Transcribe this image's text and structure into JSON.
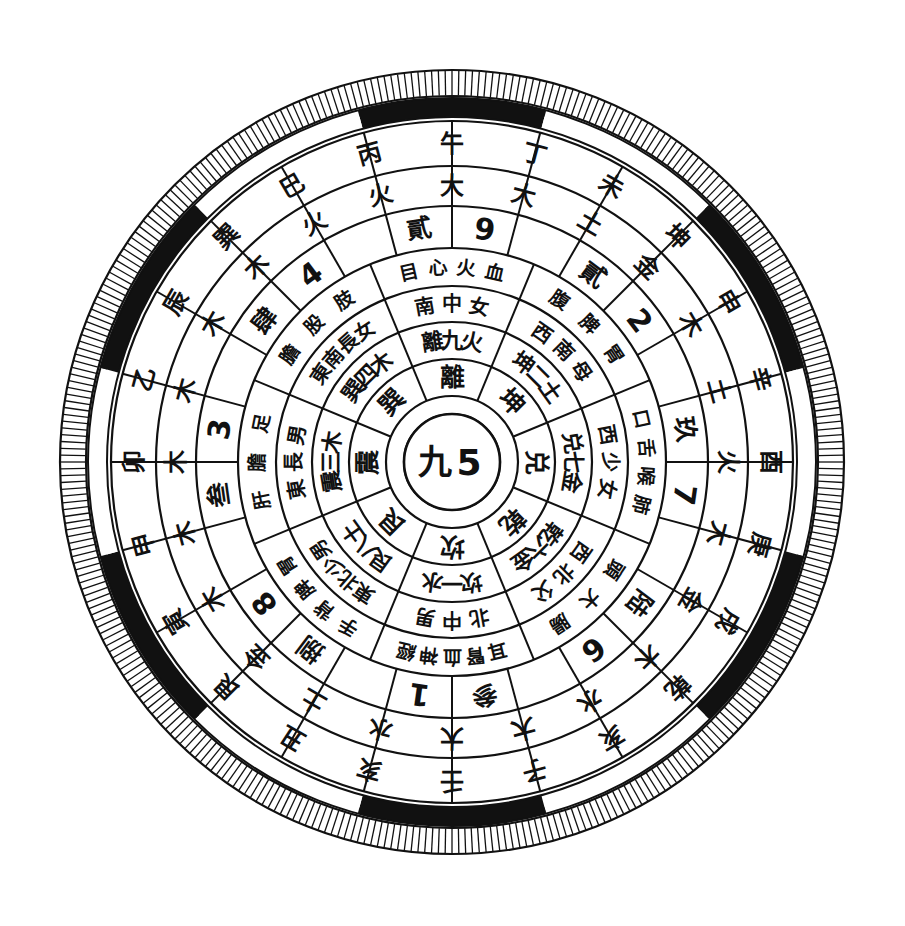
{
  "diagram": {
    "title": "九5",
    "center": {
      "chinese_numeral": "九",
      "arabic_numeral": "5"
    },
    "colors": {
      "ink": "#111111",
      "paper": "#ffffff",
      "band_dark": "#111111",
      "band_light": "#ffffff"
    },
    "rings": [
      {
        "id": "ring-degree-ticks",
        "name": "outer-degree-scale",
        "segments": 360
      },
      {
        "id": "ring-arc-band",
        "name": "alternating-black-white-band",
        "segments": 12
      },
      {
        "id": "ring-branch",
        "name": "earthly-branches-ring",
        "segments": 12
      },
      {
        "id": "ring-element",
        "name": "five-elements-ring",
        "segments": 12
      },
      {
        "id": "ring-number",
        "name": "numbers-ring",
        "segments": 12
      },
      {
        "id": "ring-body",
        "name": "body-organs-ring",
        "segments": 8
      },
      {
        "id": "ring-family",
        "name": "direction-family-ring",
        "segments": 8
      },
      {
        "id": "ring-trigram-element",
        "name": "trigram-number-element-ring",
        "segments": 8
      },
      {
        "id": "ring-trigram",
        "name": "eight-trigrams-ring",
        "segments": 8
      }
    ],
    "ring_branch": {
      "label": "earthly-branches",
      "cells": [
        "卯",
        "甲",
        "寅",
        "艮",
        "丑",
        "癸",
        "子",
        "壬",
        "亥",
        "乾",
        "戌",
        "辛",
        "酉",
        "庚",
        "申",
        "坤",
        "未",
        "丁",
        "午",
        "丙",
        "巳",
        "巽",
        "辰",
        "乙"
      ]
    },
    "ring_element": {
      "label": "five-elements-outer",
      "cells": [
        "木",
        "木",
        "木",
        "土",
        "金",
        "大",
        "大",
        "大",
        "水",
        "木",
        "金",
        "土",
        "火",
        "大",
        "木",
        "土",
        "火",
        "土",
        "大",
        "火",
        "木",
        "木",
        "木",
        "木"
      ]
    },
    "ring_number": {
      "label": "numbers-outer",
      "cells": [
        "叁",
        "3",
        "捌",
        "8",
        "五",
        "参",
        "1",
        "一",
        "陆",
        "6",
        "二",
        "玖",
        "7",
        "四",
        "貳",
        "9",
        "八",
        "4"
      ]
    },
    "ring_number_pairs": [
      {
        "cn": "叁",
        "ar": "3"
      },
      {
        "cn": "肆",
        "ar": "4"
      },
      {
        "cn": "捌",
        "ar": "8"
      },
      {
        "cn": "五",
        "ar": "5"
      },
      {
        "cn": "参",
        "ar": "3"
      },
      {
        "cn": "壹",
        "ar": "1"
      },
      {
        "cn": "陆",
        "ar": "6"
      },
      {
        "cn": "贰",
        "ar": "2"
      },
      {
        "cn": "玖",
        "ar": "9"
      },
      {
        "cn": "柒",
        "ar": "7"
      },
      {
        "cn": "贰",
        "ar": "2"
      },
      {
        "cn": "玖",
        "ar": "9"
      }
    ],
    "trigram_sectors": [
      {
        "name": "kan",
        "trigram": "坎",
        "number": "一",
        "element": "水",
        "direction": "北",
        "family": "中男",
        "body": "耳腎血神經",
        "numeral_cn": "参",
        "numeral_ar": "1",
        "outer_elements": "大 大 水",
        "branches": "子 壬 亥"
      },
      {
        "name": "gen",
        "trigram": "艮",
        "number": "八",
        "element": "土",
        "direction": "東北",
        "family": "少男",
        "body": "手背脾胃",
        "numeral_cn": "捌",
        "numeral_ar": "8",
        "outer_elements": "土 金 木",
        "branches": "丑 艮 寅"
      },
      {
        "name": "zhen",
        "trigram": "震",
        "number": "三",
        "element": "木",
        "direction": "東",
        "family": "長男",
        "body": "肝膽足",
        "numeral_cn": "叁",
        "numeral_ar": "3",
        "outer_elements": "木 木 木",
        "branches": "甲 卯 乙"
      },
      {
        "name": "xun",
        "trigram": "巽",
        "number": "四",
        "element": "木",
        "direction": "東南",
        "family": "長女",
        "body": "膽股肢",
        "numeral_cn": "肆",
        "numeral_ar": "4",
        "outer_elements": "木 木 火",
        "branches": "辰 巽 巳"
      },
      {
        "name": "li",
        "trigram": "離",
        "number": "九",
        "element": "火",
        "direction": "南",
        "family": "中女",
        "body": "目心火血",
        "numeral_cn": "貳",
        "numeral_ar": "9",
        "outer_elements": "火 大 大",
        "branches": "丙 午 丁"
      },
      {
        "name": "kun",
        "trigram": "坤",
        "number": "二",
        "element": "土",
        "direction": "西南",
        "family": "母",
        "body": "腹脾胃",
        "numeral_cn": "貳",
        "numeral_ar": "2",
        "outer_elements": "土 金 木",
        "branches": "未 坤 申"
      },
      {
        "name": "dui",
        "trigram": "兑",
        "number": "七",
        "element": "金",
        "direction": "西",
        "family": "少女",
        "body": "口舌喉肺",
        "numeral_cn": "玖",
        "numeral_ar": "7",
        "outer_elements": "土 火 大",
        "branches": "辛 酉 庚"
      },
      {
        "name": "qian",
        "trigram": "乾",
        "number": "六",
        "element": "金",
        "direction": "西北",
        "family": "父",
        "body": "頭大腸",
        "numeral_cn": "陆",
        "numeral_ar": "6",
        "outer_elements": "金 木 水",
        "branches": "戌 乾 亥"
      }
    ],
    "ring_trigram_cells": [
      "坎",
      "艮",
      "震",
      "巽",
      "離",
      "坤",
      "兑",
      "乾"
    ],
    "ring_trigram_number_cells": [
      "一水",
      "八土",
      "三木",
      "四木",
      "九火",
      "二土",
      "七金",
      "六金"
    ],
    "ring_family_cells": [
      "北中男",
      "東北少男",
      "東長男",
      "東南長女",
      "南中女",
      "西南母",
      "西少女",
      "西北父"
    ],
    "ring_body_cells": [
      "耳腎血神經",
      "手背脾胃",
      "肝膽足",
      "膽股肢",
      "目心火血",
      "腹脾胃",
      "口舌喉肺",
      "頭大腸"
    ]
  }
}
